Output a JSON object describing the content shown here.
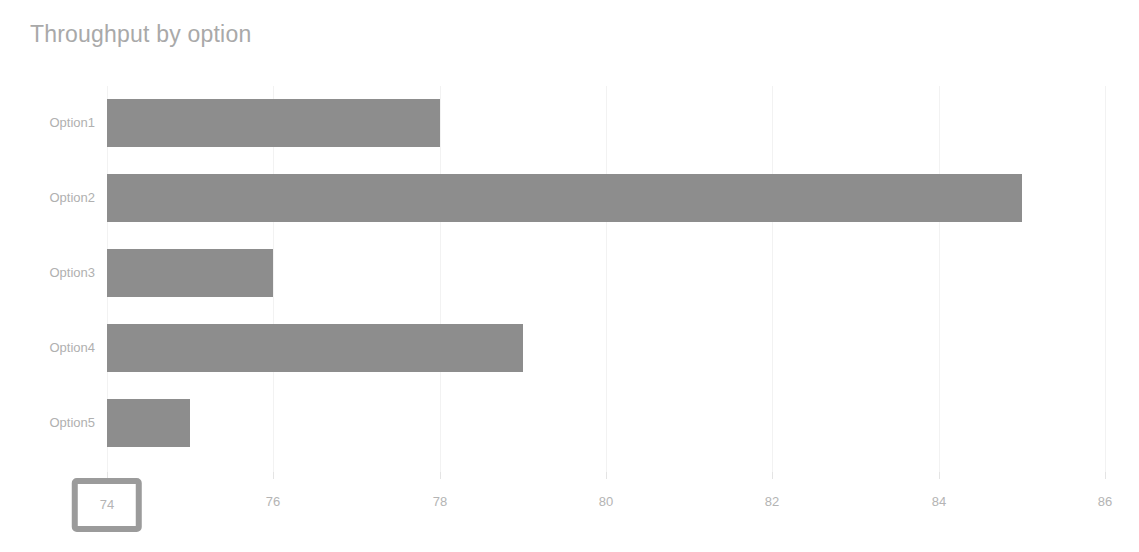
{
  "chart_data": {
    "type": "bar",
    "orientation": "horizontal",
    "title": "Throughput by option",
    "xlabel": "",
    "ylabel": "",
    "categories": [
      "Option1",
      "Option2",
      "Option3",
      "Option4",
      "Option5"
    ],
    "values": [
      78,
      85,
      76,
      79,
      75
    ],
    "xlim": [
      74,
      86
    ],
    "xticks": [
      74,
      76,
      78,
      80,
      82,
      84,
      86
    ],
    "xtick_labels": [
      "74",
      "76",
      "78",
      "80",
      "82",
      "84",
      "86"
    ],
    "highlighted_xtick": "74",
    "grid": true,
    "legend": false,
    "series": [
      {
        "name": "Throughput",
        "values": [
          78,
          85,
          76,
          79,
          75
        ]
      }
    ],
    "colors": {
      "bar": "#8d8d8d",
      "title": "#a9a9a9",
      "tick_label": "#b4b4b4",
      "gridline": "#f2f2f2",
      "highlight_border": "#9b9b9b",
      "background": "#ffffff"
    }
  }
}
